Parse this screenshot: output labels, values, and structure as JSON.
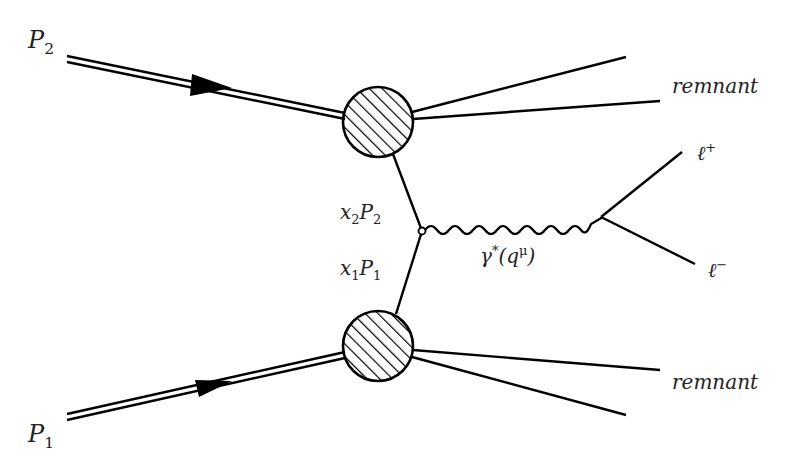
{
  "diagram": {
    "labels": {
      "p2": {
        "base": "P",
        "sub": "2"
      },
      "p1": {
        "base": "P",
        "sub": "1"
      },
      "x2p2": {
        "x": "x",
        "xsub": "2",
        "p": "P",
        "psub": "2"
      },
      "x1p1": {
        "x": "x",
        "xsub": "1",
        "p": "P",
        "psub": "1"
      },
      "photon": {
        "base": "γ",
        "sup": "*",
        "arg_open": "(q",
        "arg_sup": "μ",
        "arg_close": ")"
      },
      "remnant_top": "remnant",
      "remnant_bottom": "remnant",
      "lepton_plus": {
        "base": "ℓ",
        "sup": "+"
      },
      "lepton_minus": {
        "base": "ℓ",
        "sup": "−"
      }
    },
    "nodes": [
      {
        "id": "hadron-blob-top",
        "type": "hatched-circle",
        "cx": 378,
        "cy": 122,
        "r": 35
      },
      {
        "id": "hadron-blob-bottom",
        "type": "hatched-circle",
        "cx": 378,
        "cy": 346,
        "r": 35
      },
      {
        "id": "annihilation-vertex",
        "type": "small-circle",
        "cx": 422,
        "cy": 231
      },
      {
        "id": "decay-vertex",
        "type": "point",
        "cx": 601,
        "cy": 217
      }
    ],
    "edges": [
      {
        "from": "P2-in",
        "to": "hadron-blob-top",
        "style": "double-line-arrow"
      },
      {
        "from": "P1-in",
        "to": "hadron-blob-bottom",
        "style": "double-line-arrow"
      },
      {
        "from": "hadron-blob-top",
        "to": "annihilation-vertex",
        "style": "solid",
        "label": "x2P2"
      },
      {
        "from": "hadron-blob-bottom",
        "to": "annihilation-vertex",
        "style": "solid",
        "label": "x1P1"
      },
      {
        "from": "annihilation-vertex",
        "to": "decay-vertex",
        "style": "wavy",
        "label": "γ*(q^μ)"
      },
      {
        "from": "decay-vertex",
        "to": "lepton-plus",
        "style": "solid"
      },
      {
        "from": "decay-vertex",
        "to": "lepton-minus",
        "style": "solid"
      },
      {
        "from": "hadron-blob-top",
        "to": "remnant-top",
        "style": "solid-x2"
      },
      {
        "from": "hadron-blob-bottom",
        "to": "remnant-bottom",
        "style": "solid-x2"
      }
    ],
    "colors": {
      "line": "#000000",
      "text": "#222222",
      "background": "#ffffff"
    }
  }
}
